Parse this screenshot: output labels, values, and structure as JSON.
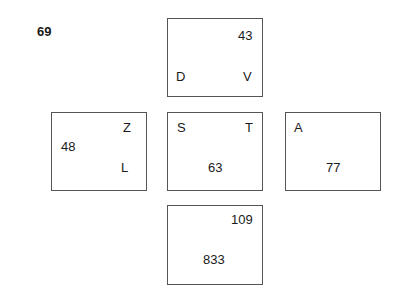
{
  "title": "69",
  "boxes": {
    "top": {
      "top_right": "43",
      "bottom_left": "D",
      "bottom_right": "V"
    },
    "left": {
      "top_right": "Z",
      "middle_left": "48",
      "bottom_right": "L"
    },
    "center": {
      "top_left": "S",
      "top_right": "T",
      "bottom_center": "63"
    },
    "right": {
      "top_left": "A",
      "bottom_center": "77"
    },
    "bottom": {
      "top_right": "109",
      "bottom_center": "833"
    }
  }
}
